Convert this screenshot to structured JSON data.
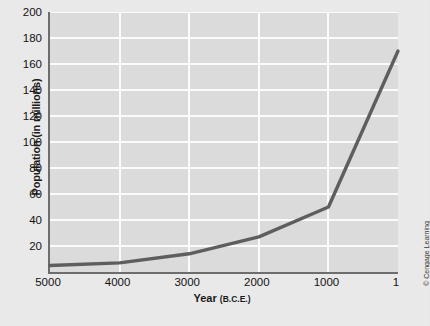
{
  "chart_data": {
    "type": "line",
    "title": "",
    "xlabel": "Year",
    "xlabel_unit": "(B.C.E.)",
    "ylabel": "Population (in millions)",
    "x": [
      5000,
      4000,
      3000,
      2000,
      1000,
      1
    ],
    "values": [
      5,
      7,
      14,
      27,
      50,
      170
    ],
    "series": [
      {
        "name": "World population",
        "values": [
          5,
          7,
          14,
          27,
          50,
          170
        ]
      }
    ],
    "xtick_labels": [
      "5000",
      "4000",
      "3000",
      "2000",
      "1000",
      "1"
    ],
    "ytick_labels": [
      "20",
      "40",
      "60",
      "80",
      "100",
      "120",
      "140",
      "160",
      "180",
      "200"
    ],
    "yticks": [
      20,
      40,
      60,
      80,
      100,
      120,
      140,
      160,
      180,
      200
    ],
    "ylim": [
      0,
      200
    ],
    "xlim": [
      5000,
      1
    ],
    "x_axis_inverted": true,
    "grid": "horizontal-and-vertical",
    "legend": "none",
    "line_color": "#5e5e5e",
    "plot_bg_color": "#dbdbdb",
    "figure_bg_color": "#e9e9e9",
    "grid_color": "#fbfbfb",
    "axis_color": "#6d6d6d"
  },
  "credit": {
    "text": "© Cengage Learning"
  }
}
